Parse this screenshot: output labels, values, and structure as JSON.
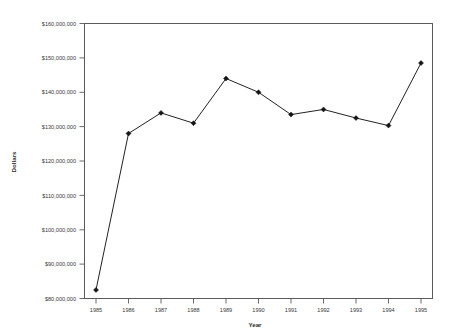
{
  "chart_data": {
    "type": "line",
    "title": "",
    "xlabel": "Year",
    "ylabel": "Dollars",
    "categories": [
      1985,
      1986,
      1987,
      1988,
      1989,
      1990,
      1991,
      1992,
      1993,
      1994,
      1995
    ],
    "x_tick_labels": [
      "1985",
      "1986",
      "1987",
      "1988",
      "1989",
      "1990",
      "1991",
      "1992",
      "1993",
      "1994",
      "1995"
    ],
    "values": [
      82500000,
      128000000,
      134000000,
      131000000,
      144000000,
      140000000,
      133500000,
      135000000,
      132500000,
      130300000,
      148500000
    ],
    "y_tick_labels": [
      "$160,000,000",
      "$150,000,000",
      "$140,000,000",
      "$130,000,000",
      "$120,000,000",
      "$110,000,000",
      "$100,000,000",
      "$90,000,000",
      "$80,000,000"
    ],
    "y_tick_values": [
      160000000,
      150000000,
      140000000,
      130000000,
      120000000,
      110000000,
      100000000,
      90000000,
      80000000
    ],
    "ylim": [
      80000000,
      160000000
    ],
    "xlim": [
      1985,
      1995
    ],
    "grid": false,
    "legend": false,
    "marker": "diamond",
    "line_color": "#222222",
    "marker_color": "#151515",
    "axis_color": "#5a5a5a",
    "background": "#ffffff"
  }
}
